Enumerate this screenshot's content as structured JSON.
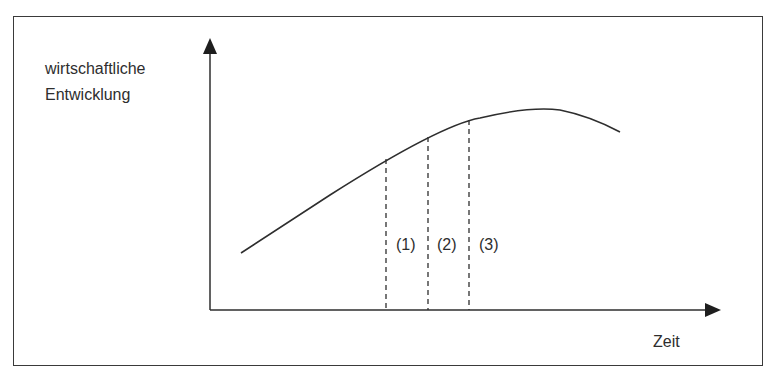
{
  "diagram": {
    "y_axis_label_line1": "wirtschaftliche",
    "y_axis_label_line2": "Entwicklung",
    "x_axis_label": "Zeit",
    "phases": [
      {
        "label": "(1)"
      },
      {
        "label": "(2)"
      },
      {
        "label": "(3)"
      }
    ],
    "colors": {
      "line": "#2e2e2e",
      "background": "#ffffff"
    }
  }
}
